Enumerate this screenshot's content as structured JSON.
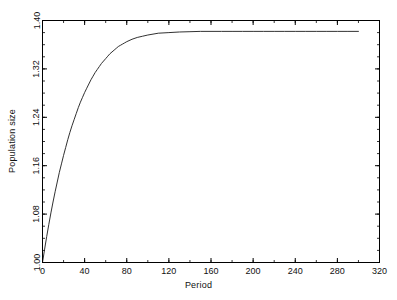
{
  "chart_data": {
    "type": "line",
    "title": "",
    "subtitle": "",
    "xlabel": "Period",
    "ylabel": "Population size",
    "xlim": [
      0,
      320
    ],
    "ylim": [
      1.0,
      1.4
    ],
    "xticks": [
      0,
      40,
      80,
      120,
      160,
      200,
      240,
      280,
      320
    ],
    "xtick_labels": [
      "0",
      "40",
      "80",
      "120",
      "160",
      "200",
      "240",
      "280",
      "320"
    ],
    "yticks": [
      1.0,
      1.08,
      1.16,
      1.24,
      1.32,
      1.4
    ],
    "ytick_labels": [
      "1.00",
      "1.08",
      "1.16",
      "1.24",
      "1.32",
      "1.40"
    ],
    "x_minor_tick_step": 20,
    "y_minor_tick_step": 0.02,
    "grid": false,
    "legend": "none",
    "line_color": "#1a1a1a",
    "line_width": 0.9,
    "background_color": "#ffffff",
    "frame_color": "#000000",
    "annotations": [],
    "series": [
      {
        "name": "Population size",
        "x": [
          0,
          2,
          4,
          6,
          8,
          10,
          12,
          14,
          16,
          18,
          20,
          22,
          24,
          26,
          28,
          30,
          32,
          34,
          36,
          38,
          40,
          42,
          44,
          46,
          48,
          50,
          52,
          54,
          56,
          58,
          60,
          62,
          64,
          66,
          68,
          70,
          72,
          74,
          76,
          78,
          80,
          85,
          90,
          95,
          100,
          110,
          120,
          130,
          140,
          150,
          160,
          170,
          180,
          190,
          200,
          210,
          220,
          230,
          240,
          250,
          260,
          270,
          280,
          290,
          300
        ],
        "values": [
          1.0,
          1.022,
          1.043,
          1.063,
          1.082,
          1.1,
          1.117,
          1.133,
          1.149,
          1.163,
          1.177,
          1.19,
          1.203,
          1.215,
          1.226,
          1.236,
          1.246,
          1.256,
          1.265,
          1.273,
          1.281,
          1.288,
          1.295,
          1.302,
          1.308,
          1.314,
          1.319,
          1.324,
          1.329,
          1.333,
          1.337,
          1.341,
          1.345,
          1.348,
          1.351,
          1.354,
          1.357,
          1.359,
          1.361,
          1.363,
          1.365,
          1.369,
          1.372,
          1.374,
          1.376,
          1.379,
          1.38,
          1.381,
          1.3815,
          1.382,
          1.382,
          1.382,
          1.382,
          1.382,
          1.382,
          1.382,
          1.382,
          1.382,
          1.382,
          1.382,
          1.382,
          1.382,
          1.382,
          1.382,
          1.382
        ]
      }
    ],
    "plateau_value": 1.382,
    "start_value": 1.0,
    "data_x_end": 300
  }
}
